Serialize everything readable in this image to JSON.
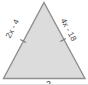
{
  "figure": {
    "shape": "isosceles-triangle",
    "fill_color": "#dcdcdc",
    "stroke_color": "#8f8f8f",
    "labels": {
      "left_side": "2x - 4",
      "right_side": "4x - 18",
      "bottom_partial": "2"
    },
    "tick_marks": [
      "left-side-tick",
      "right-side-tick"
    ]
  }
}
